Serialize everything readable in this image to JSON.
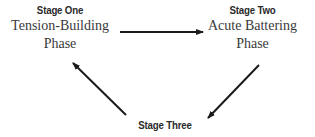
{
  "diagram": {
    "type": "cycle",
    "stages": [
      {
        "title": "Stage One",
        "description_lines": [
          "Tension-Building",
          "Phase"
        ]
      },
      {
        "title": "Stage Two",
        "description_lines": [
          "Acute Battering",
          "Phase"
        ]
      },
      {
        "title": "Stage Three",
        "description_lines": []
      }
    ],
    "arrows": [
      {
        "from": "Stage One",
        "to": "Stage Two",
        "icon": "arrow-right-icon"
      },
      {
        "from": "Stage Two",
        "to": "Stage Three",
        "icon": "arrow-down-left-icon"
      },
      {
        "from": "Stage Three",
        "to": "Stage One",
        "icon": "arrow-up-left-icon"
      }
    ],
    "colors": {
      "text": "#2a2a2a",
      "arrow": "#1a1a1a",
      "background": "#ffffff"
    }
  }
}
